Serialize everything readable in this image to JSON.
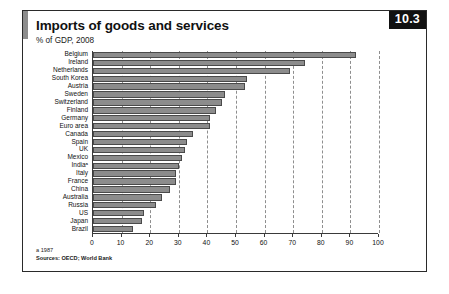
{
  "figure": {
    "badge": "10.3",
    "title": "Imports of goods and services",
    "subtitle": "% of GDP, 2008",
    "footnote": "a 1987",
    "source": "Sources: OECD; World Bank"
  },
  "chart_data": {
    "type": "bar",
    "orientation": "horizontal",
    "title": "Imports of goods and services",
    "subtitle": "% of GDP, 2008",
    "xlabel": "",
    "ylabel": "",
    "xlim": [
      0,
      100
    ],
    "xticks": [
      0,
      10,
      20,
      30,
      40,
      50,
      60,
      70,
      80,
      90,
      100
    ],
    "grid": true,
    "grid_axis": "x",
    "grid_style": "dashed",
    "legend": false,
    "bar_color": "#8c8c8c",
    "categories": [
      "Belgium",
      "Ireland",
      "Netherlands",
      "South Korea",
      "Austria",
      "Sweden",
      "Switzerland",
      "Finland",
      "Germany",
      "Euro area",
      "Canada",
      "Spain",
      "UK",
      "Mexico",
      "Indiaᵃ",
      "Italy",
      "France",
      "China",
      "Australia",
      "Russia",
      "US",
      "Japan",
      "Brazil"
    ],
    "values": [
      92,
      74,
      69,
      54,
      53,
      46,
      45,
      43,
      41,
      41,
      35,
      33,
      32,
      31,
      30,
      29,
      29,
      27,
      24,
      22,
      18,
      17,
      14
    ]
  }
}
